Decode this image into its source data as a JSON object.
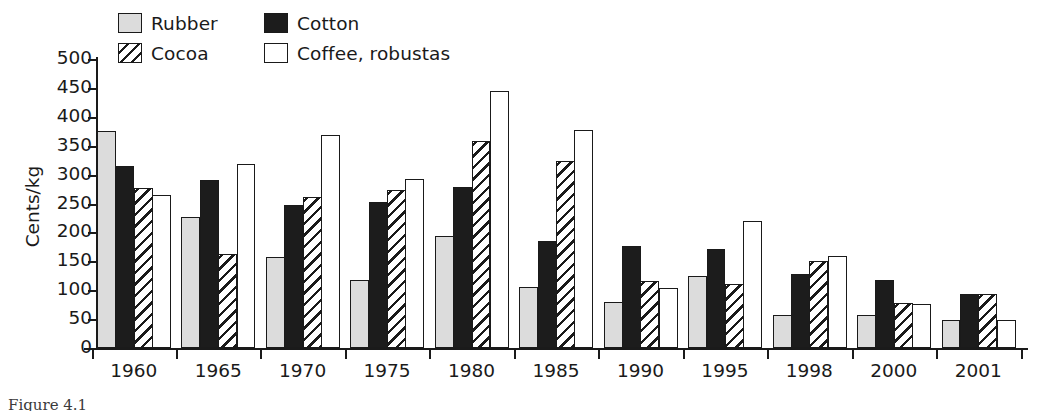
{
  "chart_data": {
    "type": "bar",
    "title": "",
    "xlabel": "",
    "ylabel": "Cents/kg",
    "ylim": [
      0,
      500
    ],
    "ytick_step": 50,
    "yticks": [
      "500",
      "450",
      "400",
      "350",
      "300",
      "250",
      "200",
      "150",
      "100",
      "50",
      "0"
    ],
    "grid": false,
    "legend_position": "top-left",
    "categories": [
      "1960",
      "1965",
      "1970",
      "1975",
      "1980",
      "1985",
      "1990",
      "1995",
      "1998",
      "2000",
      "2001"
    ],
    "series": [
      {
        "name": "Rubber",
        "key": "rubber",
        "swatch": "light-gray-fill",
        "values": [
          375,
          227,
          157,
          117,
          193,
          105,
          80,
          124,
          57,
          57,
          48
        ]
      },
      {
        "name": "Cotton",
        "key": "cotton",
        "swatch": "black-fill",
        "values": [
          315,
          290,
          247,
          253,
          279,
          185,
          176,
          172,
          128,
          118,
          94
        ]
      },
      {
        "name": "Cocoa",
        "key": "cocoa",
        "swatch": "diagonal-hatch",
        "values": [
          277,
          163,
          262,
          273,
          358,
          324,
          116,
          110,
          150,
          77,
          93
        ]
      },
      {
        "name": "Coffee, robustas",
        "key": "coffee",
        "swatch": "white-fill",
        "values": [
          264,
          319,
          369,
          293,
          444,
          377,
          104,
          219,
          160,
          76,
          49
        ]
      }
    ]
  },
  "legend": {
    "items": [
      {
        "label": "Rubber",
        "swatch": "rubber"
      },
      {
        "label": "Cotton",
        "swatch": "cotton"
      },
      {
        "label": "Cocoa",
        "swatch": "cocoa"
      },
      {
        "label": "Coffee, robustas",
        "swatch": "coffee"
      }
    ]
  },
  "caption": {
    "text": "Figure 4.1"
  },
  "colors": {
    "axis": "#1a1a1a",
    "rubber": "#dcdcdc",
    "cotton": "#1c1c1c",
    "cocoa_hatch": "#1a1a1a",
    "coffee": "#ffffff",
    "background": "#ffffff"
  }
}
